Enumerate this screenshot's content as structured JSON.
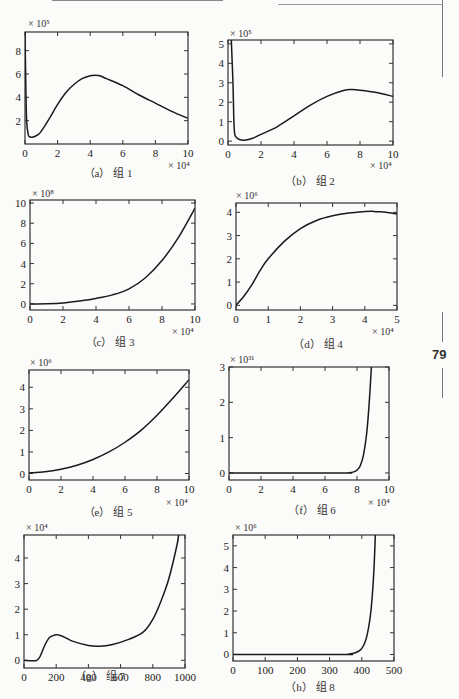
{
  "page": {
    "page_number": "79"
  },
  "chart_data": [
    {
      "id": "a",
      "type": "line",
      "caption": "（a） 组 1",
      "y_multiplier": "× 10⁵",
      "x_multiplier": "× 10⁴",
      "xlim": [
        0,
        10
      ],
      "ylim": [
        0,
        9.6
      ],
      "xticks": [
        0,
        2,
        4,
        6,
        8,
        10
      ],
      "yticks": [
        2,
        4,
        6,
        8
      ],
      "x": [
        0,
        0.05,
        0.1,
        0.2,
        0.3,
        0.5,
        0.8,
        1,
        1.5,
        2,
        2.5,
        3,
        3.5,
        4,
        4.3,
        4.6,
        5,
        6,
        7,
        8,
        9,
        10
      ],
      "y": [
        9.6,
        5,
        2,
        0.8,
        0.6,
        0.6,
        0.8,
        1.1,
        2.2,
        3.4,
        4.4,
        5.1,
        5.6,
        5.85,
        5.9,
        5.85,
        5.6,
        5.0,
        4.2,
        3.5,
        2.8,
        2.2
      ]
    },
    {
      "id": "b",
      "type": "line",
      "caption": "（b） 组 2",
      "y_multiplier": "× 10⁵",
      "x_multiplier": "× 10⁴",
      "xlim": [
        0,
        10
      ],
      "ylim": [
        -0.2,
        5.2
      ],
      "xticks": [
        0,
        2,
        4,
        6,
        8,
        10
      ],
      "yticks": [
        0,
        1,
        2,
        3,
        4,
        5
      ],
      "x": [
        0.2,
        0.3,
        0.35,
        0.4,
        0.5,
        0.7,
        1,
        1.5,
        2,
        3,
        4,
        5,
        6,
        7,
        7.5,
        8,
        9,
        10
      ],
      "y": [
        5.2,
        3,
        1.2,
        0.4,
        0.2,
        0.08,
        0.05,
        0.15,
        0.35,
        0.75,
        1.3,
        1.85,
        2.3,
        2.6,
        2.65,
        2.62,
        2.5,
        2.3
      ]
    },
    {
      "id": "c",
      "type": "line",
      "caption": "（c） 组 3",
      "y_multiplier": "× 10⁸",
      "x_multiplier": "× 10⁴",
      "xlim": [
        0,
        10
      ],
      "ylim": [
        -0.6,
        10.3
      ],
      "xticks": [
        0,
        2,
        4,
        6,
        8,
        10
      ],
      "yticks": [
        0,
        2,
        4,
        6,
        8,
        10
      ],
      "x": [
        0,
        1,
        2,
        3,
        4,
        5,
        6,
        7,
        8,
        9,
        10
      ],
      "y": [
        0,
        0.02,
        0.1,
        0.3,
        0.55,
        0.9,
        1.5,
        2.6,
        4.3,
        6.6,
        9.5
      ]
    },
    {
      "id": "d",
      "type": "line",
      "caption": "（d） 组 4",
      "y_multiplier": "× 10⁶",
      "x_multiplier": "× 10⁴",
      "xlim": [
        0,
        5
      ],
      "ylim": [
        -0.2,
        4.4
      ],
      "xticks": [
        0,
        1,
        2,
        3,
        4,
        5
      ],
      "yticks": [
        0,
        1,
        2,
        3,
        4
      ],
      "x": [
        0,
        0.25,
        0.5,
        0.75,
        1,
        1.5,
        2,
        2.5,
        3,
        3.5,
        4,
        4.25,
        4.5,
        5
      ],
      "y": [
        0,
        0.4,
        0.9,
        1.5,
        2.0,
        2.75,
        3.3,
        3.65,
        3.85,
        3.97,
        4.03,
        4.04,
        4.02,
        3.93
      ]
    },
    {
      "id": "e",
      "type": "line",
      "caption": "（e） 组 5",
      "y_multiplier": "× 10⁶",
      "x_multiplier": "× 10⁴",
      "xlim": [
        0,
        10
      ],
      "ylim": [
        -0.3,
        4.8
      ],
      "xticks": [
        0,
        2,
        4,
        6,
        8,
        10
      ],
      "yticks": [
        0,
        1,
        2,
        3,
        4
      ],
      "x": [
        0,
        1,
        2,
        3,
        4,
        5,
        6,
        7,
        8,
        9,
        10
      ],
      "y": [
        0.03,
        0.08,
        0.2,
        0.38,
        0.65,
        1.0,
        1.45,
        2.0,
        2.7,
        3.5,
        4.35
      ]
    },
    {
      "id": "f",
      "type": "line",
      "caption": "（f） 组 6",
      "y_multiplier": "× 10³¹",
      "x_multiplier": "× 10⁴",
      "xlim": [
        0,
        10
      ],
      "ylim": [
        -0.2,
        3
      ],
      "xticks": [
        0,
        2,
        4,
        6,
        8,
        10
      ],
      "yticks": [
        0,
        1,
        2,
        3
      ],
      "x": [
        0,
        7,
        7.5,
        7.8,
        8,
        8.2,
        8.4,
        8.6,
        8.75,
        8.9
      ],
      "y": [
        0,
        0,
        0.005,
        0.03,
        0.08,
        0.2,
        0.5,
        1.1,
        1.9,
        3.0
      ]
    },
    {
      "id": "g",
      "type": "line",
      "caption": "（g） 组 7",
      "y_multiplier": "× 10⁴",
      "x_multiplier": "",
      "xlim": [
        0,
        1000
      ],
      "ylim": [
        -0.3,
        4.9
      ],
      "xticks": [
        0,
        200,
        400,
        600,
        800,
        1000
      ],
      "yticks": [
        0,
        1,
        2,
        3,
        4
      ],
      "x": [
        0,
        50,
        80,
        100,
        130,
        160,
        200,
        220,
        260,
        300,
        400,
        470,
        550,
        650,
        740,
        800,
        850,
        900,
        950,
        960
      ],
      "y": [
        0,
        -0.02,
        0,
        0.15,
        0.6,
        0.9,
        1.0,
        0.98,
        0.88,
        0.75,
        0.58,
        0.55,
        0.62,
        0.82,
        1.1,
        1.6,
        2.3,
        3.2,
        4.5,
        4.9
      ]
    },
    {
      "id": "h",
      "type": "line",
      "caption": "（h） 组 8",
      "y_multiplier": "× 10⁶",
      "x_multiplier": "",
      "xlim": [
        0,
        500
      ],
      "ylim": [
        -0.3,
        5.5
      ],
      "xticks": [
        0,
        100,
        200,
        300,
        400,
        500
      ],
      "yticks": [
        0,
        1,
        2,
        3,
        4,
        5
      ],
      "x": [
        0,
        340,
        360,
        380,
        395,
        405,
        415,
        425,
        432,
        438,
        442
      ],
      "y": [
        0,
        0,
        0.02,
        0.08,
        0.2,
        0.4,
        0.8,
        1.6,
        2.6,
        4.0,
        5.5
      ]
    }
  ]
}
